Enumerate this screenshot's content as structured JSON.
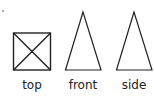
{
  "diagram": {
    "views": [
      {
        "name": "top",
        "label": "top",
        "shape": "square-with-diagonals"
      },
      {
        "name": "front",
        "label": "front",
        "shape": "isosceles-triangle"
      },
      {
        "name": "side",
        "label": "side",
        "shape": "isosceles-triangle"
      }
    ],
    "stroke_color": "#222222"
  }
}
